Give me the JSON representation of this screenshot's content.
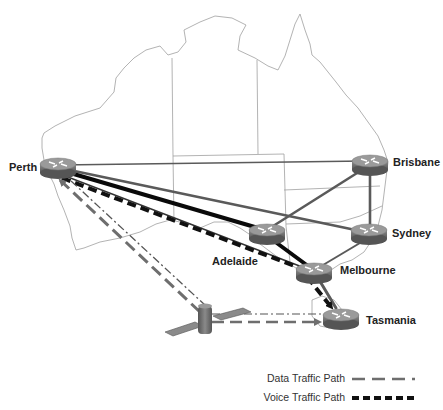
{
  "diagram": {
    "type": "network-topology-map",
    "background_map": "Australia outline with state borders",
    "colors": {
      "map_outline": "#9a9a9a",
      "data_path": "#6e6e6e",
      "voice_path": "#111111",
      "link_gray": "#5a5a5a",
      "link_black": "#0a0a0a",
      "router_body": "#7c7c7c",
      "router_top": "#9a9a9a"
    },
    "nodes": [
      {
        "id": "perth",
        "label": "Perth",
        "type": "router"
      },
      {
        "id": "brisbane",
        "label": "Brisbane",
        "type": "router"
      },
      {
        "id": "adelaide",
        "label": "Adelaide",
        "type": "router"
      },
      {
        "id": "sydney",
        "label": "Sydney",
        "type": "router"
      },
      {
        "id": "melbourne",
        "label": "Melbourne",
        "type": "router"
      },
      {
        "id": "tasmania",
        "label": "Tasmania",
        "type": "router"
      },
      {
        "id": "satellite",
        "label": "",
        "type": "satellite"
      }
    ],
    "links": [
      {
        "from": "perth",
        "to": "brisbane",
        "style": "solid-thin"
      },
      {
        "from": "perth",
        "to": "sydney",
        "style": "solid-gray"
      },
      {
        "from": "perth",
        "to": "adelaide",
        "style": "solid-black-thick"
      },
      {
        "from": "perth",
        "to": "melbourne",
        "style": "solid-thin"
      },
      {
        "from": "adelaide",
        "to": "brisbane",
        "style": "solid-gray"
      },
      {
        "from": "adelaide",
        "to": "melbourne",
        "style": "solid-black-thick"
      },
      {
        "from": "brisbane",
        "to": "sydney",
        "style": "solid-gray"
      },
      {
        "from": "sydney",
        "to": "melbourne",
        "style": "solid-gray"
      },
      {
        "from": "melbourne",
        "to": "tasmania",
        "style": "solid-gray"
      },
      {
        "from": "perth",
        "to": "melbourne",
        "style": "voice-traffic-path"
      },
      {
        "from": "melbourne",
        "to": "tasmania",
        "style": "voice-traffic-path"
      },
      {
        "from": "satellite",
        "to": "perth",
        "style": "data-traffic-path"
      },
      {
        "from": "satellite",
        "to": "tasmania",
        "style": "data-traffic-path"
      }
    ]
  },
  "legend": {
    "items": [
      {
        "label": "Data Traffic Path",
        "style": "data"
      },
      {
        "label": "Voice Traffic Path",
        "style": "voice"
      }
    ]
  }
}
